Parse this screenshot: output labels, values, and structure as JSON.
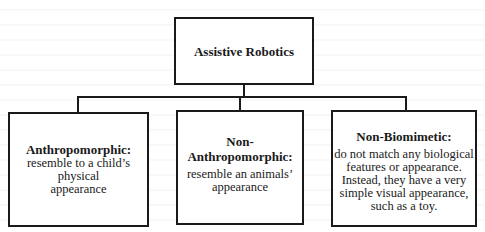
{
  "diagram": {
    "type": "hierarchy",
    "root": {
      "label": "Assistive Robotics"
    },
    "children": [
      {
        "title": "Anthropomorphic:",
        "description_lines": [
          "resemble to a child’s",
          "physical",
          "appearance"
        ]
      },
      {
        "title_lines": [
          "Non-",
          "Anthropomorphic:"
        ],
        "description_lines": [
          "resemble an animals’",
          "appearance"
        ]
      },
      {
        "title": "Non-Biomimetic:",
        "description_lines": [
          "do not match any biological",
          "features or appearance.",
          "Instead, they have a very",
          "simple visual appearance,",
          "such as a toy."
        ]
      }
    ],
    "colors": {
      "line": "#1a1a1a",
      "box_fill": "#ffffff"
    }
  }
}
